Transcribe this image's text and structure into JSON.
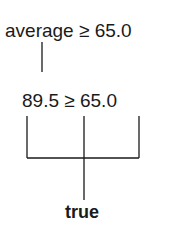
{
  "diagram": {
    "expression": "average ≥ 65.0",
    "substituted": {
      "left": "89.5",
      "operator": "≥",
      "right": "65.0",
      "full": "89.5 ≥ 65.0"
    },
    "result": "true",
    "line_color": "#1a1a1a"
  }
}
